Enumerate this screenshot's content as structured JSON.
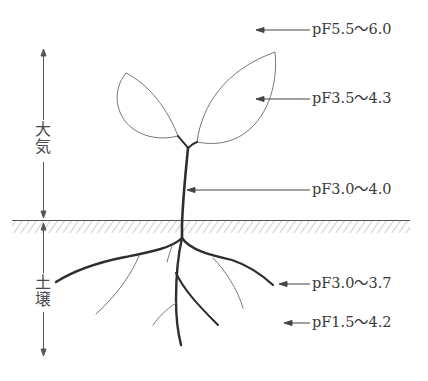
{
  "diagram": {
    "zones": {
      "atmosphere": {
        "label_line1": "大",
        "label_line2": "気"
      },
      "soil": {
        "label_line1": "土",
        "label_line2": "壌"
      }
    },
    "annotations": [
      {
        "id": "air",
        "text": "pF5.5～6.0",
        "target": "atmosphere"
      },
      {
        "id": "leaf",
        "text": "pF3.5～4.3",
        "target": "leaf"
      },
      {
        "id": "stem",
        "text": "pF3.0～4.0",
        "target": "stem"
      },
      {
        "id": "root",
        "text": "pF3.0～3.7",
        "target": "root"
      },
      {
        "id": "soil",
        "text": "pF1.5～4.2",
        "target": "soil"
      }
    ],
    "colors": {
      "line": "#3a3a3a",
      "thin_line": "#7a7a7a",
      "hatch": "#c8c8c8",
      "background": "#ffffff"
    }
  }
}
